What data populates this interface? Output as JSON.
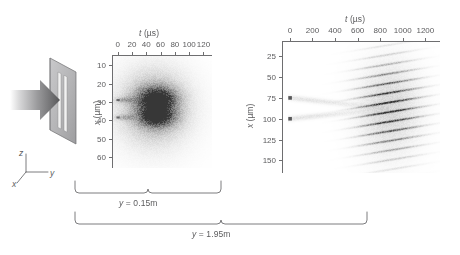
{
  "figure": {
    "background": "#ffffff",
    "ink": "#5c5c5e"
  },
  "schematic": {
    "name": "beam-and-double-slit",
    "arrow_label": "incident-beam-arrow",
    "mask_label": "double-slit-mask",
    "axes": {
      "z": "z",
      "y": "y",
      "x": "x"
    }
  },
  "panels": [
    {
      "id": "near-field",
      "xlabel": "t (µs)",
      "xlabel_italic": "t",
      "xlabel_unit": "(µs)",
      "ylabel": "x (µm)",
      "ylabel_italic": "x",
      "ylabel_unit": "(µm)",
      "xticks": [
        0,
        20,
        40,
        60,
        80,
        100,
        120
      ],
      "yticks": [
        10,
        20,
        30,
        40,
        50,
        60
      ],
      "xlim": [
        -8,
        132
      ],
      "ylim": [
        5,
        66
      ],
      "bracket_label": "y = 0.15m"
    },
    {
      "id": "far-field",
      "xlabel": "t (µs)",
      "xlabel_italic": "t",
      "xlabel_unit": "(µs)",
      "ylabel": "x (µm)",
      "ylabel_italic": "x",
      "ylabel_unit": "(µm)",
      "xticks": [
        0,
        200,
        400,
        600,
        800,
        1000,
        1200
      ],
      "yticks": [
        25,
        50,
        75,
        100,
        125,
        150
      ],
      "xlim": [
        -70,
        1330
      ],
      "ylim": [
        8,
        165
      ],
      "bracket_label": "y = 1.95m"
    }
  ],
  "brackets": [
    {
      "name": "near-field-distance-bracket",
      "label": "y = 0.15m"
    },
    {
      "name": "far-field-distance-bracket",
      "label": "y = 1.95m"
    }
  ],
  "chart_data": [
    {
      "type": "heatmap",
      "id": "near-field-density",
      "title": "",
      "xlabel": "t (µs)",
      "ylabel": "x (µm)",
      "xlim": [
        -8,
        132
      ],
      "ylim": [
        5,
        66
      ],
      "xticks": [
        0,
        20,
        40,
        60,
        80,
        100,
        120
      ],
      "yticks": [
        10,
        20,
        30,
        40,
        50,
        60
      ],
      "grid": false,
      "legend": "none",
      "colormap": "grayscale-inverted",
      "annotation": "Two dark lobes centred near x = 28 µm and x = 38 µm, merging into a thin fork at t ≈ 0, surrounded by a diffuse halo",
      "blobs": [
        {
          "t": 55,
          "x": 28.5,
          "sigma_t": 17,
          "sigma_x": 4.2,
          "amp": 1.0
        },
        {
          "t": 55,
          "x": 38.0,
          "sigma_t": 16,
          "sigma_x": 3.6,
          "amp": 0.92
        },
        {
          "t": 52,
          "x": 33.0,
          "sigma_t": 26,
          "sigma_x": 10.5,
          "amp": 0.4
        },
        {
          "t": 50,
          "x": 33.0,
          "sigma_t": 40,
          "sigma_x": 17.0,
          "amp": 0.18
        },
        {
          "t": 10,
          "x": 29.0,
          "sigma_t": 9,
          "sigma_x": 1.1,
          "amp": 0.3
        },
        {
          "t": 10,
          "x": 38.5,
          "sigma_t": 9,
          "sigma_x": 1.1,
          "amp": 0.26
        }
      ],
      "source_marks": [
        {
          "t": 0,
          "x": 29.0
        },
        {
          "t": 0,
          "x": 38.5
        }
      ]
    },
    {
      "type": "heatmap",
      "id": "far-field-density",
      "title": "",
      "xlabel": "t (µs)",
      "ylabel": "x (µm)",
      "xlim": [
        -70,
        1330
      ],
      "ylim": [
        8,
        165
      ],
      "xticks": [
        0,
        200,
        400,
        600,
        800,
        1000,
        1200
      ],
      "yticks": [
        25,
        50,
        75,
        100,
        125,
        150
      ],
      "grid": false,
      "legend": "none",
      "colormap": "grayscale-inverted",
      "annotation": "Interference pattern: about 8 tilted fringes inside an elliptical envelope centred near t = 870 µs, x = 88 µm; faint streaks lead back to two source marks at x = 75 and x = 100 µm",
      "envelope": {
        "t": 880,
        "x": 88,
        "sigma_t": 175,
        "sigma_x": 36
      },
      "fringes": {
        "count": 8,
        "spacing_x": 11.5,
        "tilt": 0.022,
        "first_center_x": 46,
        "width_x": 3.2
      },
      "source_marks": [
        {
          "t": 0,
          "x": 75
        },
        {
          "t": 0,
          "x": 100
        }
      ]
    }
  ]
}
